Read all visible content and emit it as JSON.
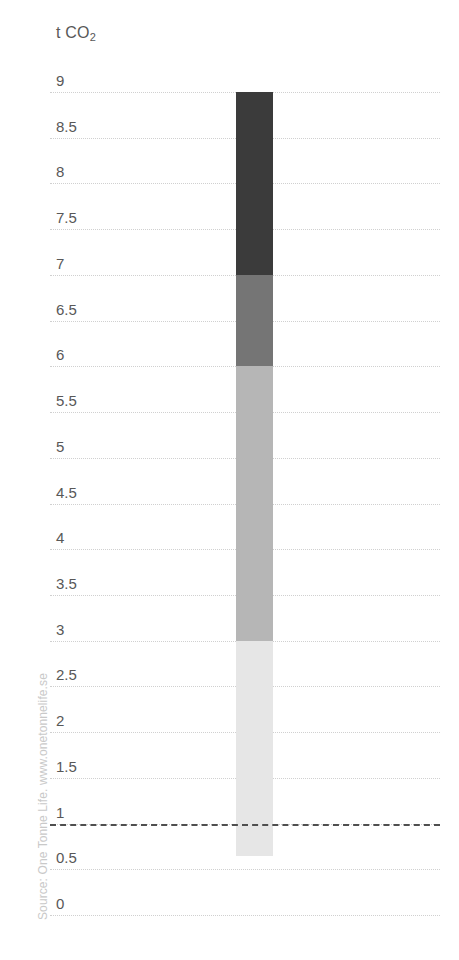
{
  "axis": {
    "unit_label": "t CO",
    "unit_subscript": "2",
    "ticks": [
      "9",
      "8.5",
      "8",
      "7.5",
      "7",
      "6.5",
      "6",
      "5.5",
      "5",
      "4.5",
      "4",
      "3.5",
      "3",
      "2.5",
      "2",
      "1.5",
      "1",
      "0.5",
      "0"
    ],
    "tick_values": [
      9,
      8.5,
      8,
      7.5,
      7,
      6.5,
      6,
      5.5,
      5,
      4.5,
      4,
      3.5,
      3,
      2.5,
      2,
      1.5,
      1,
      0.5,
      0
    ]
  },
  "source": {
    "text": "Source: One Tonne Life. www.onetonnelife.se"
  },
  "reference": {
    "label": "1",
    "value": 1
  },
  "chart_data": {
    "type": "bar",
    "title": "",
    "subtitle": "",
    "xlabel": "",
    "ylabel": "t CO2",
    "ylim": [
      0,
      9.25
    ],
    "grid": true,
    "grid_style": "dotted",
    "legend": "none",
    "orientation": "vertical",
    "stacked": true,
    "categories": [
      "Average Swede"
    ],
    "series": [
      {
        "name": "Segment 1 (bottom)",
        "from": 0.65,
        "to": 3,
        "value": 2.35,
        "color": "#e6e6e6"
      },
      {
        "name": "Segment 2",
        "from": 3,
        "to": 6,
        "value": 3,
        "color": "#b6b6b6"
      },
      {
        "name": "Segment 3",
        "from": 6,
        "to": 7,
        "value": 1,
        "color": "#757575"
      },
      {
        "name": "Segment 4 (top)",
        "from": 7,
        "to": 9,
        "value": 2,
        "color": "#3b3b3b"
      }
    ],
    "total": 8.35,
    "bar_bottom": 0.65,
    "bar_top": 9,
    "reference_line": {
      "value": 1,
      "style": "dashed",
      "color": "#4f4f4f"
    }
  },
  "colors": {
    "segment_darkest": "#3b3b3b",
    "segment_dark": "#757575",
    "segment_mid": "#b6b6b6",
    "segment_light": "#e6e6e6",
    "gridline": "#d0d0d0",
    "reference_line": "#4f4f4f",
    "text": "#585858",
    "source_text": "#c9c9c9",
    "background": "#ffffff"
  }
}
